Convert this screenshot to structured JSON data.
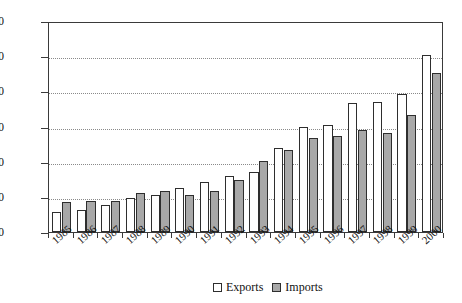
{
  "chart_data": {
    "type": "bar",
    "title": "",
    "subtitle": "",
    "xlabel": "",
    "ylabel": "",
    "categories": [
      "1985",
      "1986",
      "1987",
      "1988",
      "1989",
      "1990",
      "1991",
      "1992",
      "1993",
      "1994",
      "1995",
      "1996",
      "1997",
      "1998",
      "1999",
      "2000"
    ],
    "series": [
      {
        "name": "Exports",
        "color": "#ffffff",
        "values": [
          28,
          32,
          39,
          48,
          53,
          62,
          71,
          80,
          86,
          120,
          150,
          152,
          183,
          185,
          196,
          251
        ]
      },
      {
        "name": "Imports",
        "color": "#a8a8a8",
        "values": [
          43,
          44,
          44,
          56,
          59,
          53,
          59,
          74,
          101,
          117,
          133,
          137,
          145,
          141,
          167,
          226
        ]
      }
    ],
    "ylim": [
      0,
      300
    ],
    "yticks": [
      0,
      50,
      100,
      150,
      200,
      250,
      300
    ],
    "ytick_labels": [
      "0",
      "50",
      "100",
      "150",
      "200",
      "250",
      "300"
    ],
    "grid": "horizontal-dotted",
    "legend_position": "bottom-center"
  },
  "legend": {
    "items": [
      {
        "label": "Exports",
        "swatch": "white-square"
      },
      {
        "label": "Imports",
        "swatch": "gray-square"
      }
    ]
  }
}
